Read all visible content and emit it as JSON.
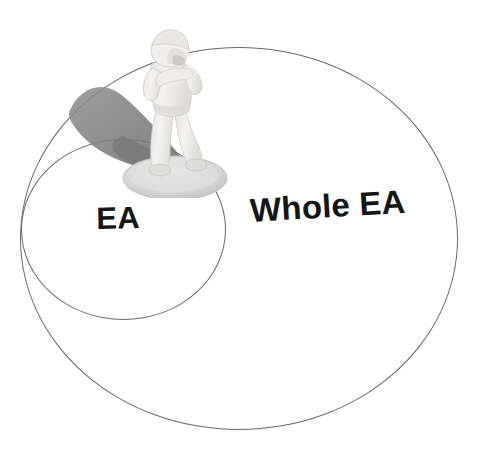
{
  "diagram": {
    "type": "venn-nested",
    "background_color": "#ffffff",
    "outline_color": "#6a6a6a",
    "label_color": "#151515",
    "sets": [
      {
        "id": "whole-ea",
        "label": "Whole EA",
        "shape": "ellipse",
        "role": "outer-superset",
        "bbox": {
          "x": 20,
          "y": 47,
          "width": 436,
          "height": 381
        },
        "label_position": {
          "x": 249,
          "y": 192
        },
        "label_rotation_deg": -3.4,
        "label_font_size": 33
      },
      {
        "id": "ea",
        "label": "EA",
        "shape": "circle",
        "role": "inner-subset",
        "bbox": {
          "x": 21,
          "y": 139,
          "width": 203,
          "height": 179
        },
        "label_position": {
          "x": 96,
          "y": 201
        },
        "label_rotation_deg": -1.2,
        "label_font_size": 31
      }
    ],
    "photo_object": {
      "name": "figurine-photo",
      "description": "white miniature figurine of a standing person on a round disc base",
      "figure_color": "#f0efed",
      "shadow_color": "#808080",
      "base_color": "#d6d6d6",
      "bbox": {
        "x": 60,
        "y": 18,
        "width": 185,
        "height": 180
      },
      "placement": "straddling the boundary between the EA circle and the Whole EA ellipse"
    }
  }
}
